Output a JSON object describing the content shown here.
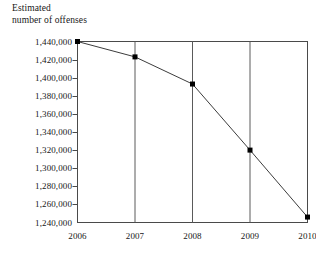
{
  "chart_data": {
    "type": "line",
    "title": "",
    "ylabel": "Estimated\nnumber of offenses",
    "xlabel": "",
    "categories": [
      "2006",
      "2007",
      "2008",
      "2009",
      "2010"
    ],
    "x": [
      2006,
      2007,
      2008,
      2009,
      2010
    ],
    "values": [
      1440000,
      1423000,
      1393000,
      1320000,
      1246000
    ],
    "series": [
      {
        "name": "Estimated number of offenses",
        "values": [
          1440000,
          1423000,
          1393000,
          1320000,
          1246000
        ]
      }
    ],
    "ylim": [
      1240000,
      1440000
    ],
    "ytick_values": [
      1440000,
      1420000,
      1400000,
      1380000,
      1360000,
      1340000,
      1320000,
      1300000,
      1280000,
      1260000,
      1240000
    ],
    "ytick_labels": [
      "1,440,000",
      "1,420,000",
      "1,400,000",
      "1,380,000",
      "1,360,000",
      "1,340,000",
      "1,320,000",
      "1,300,000",
      "1,280,000",
      "1,260,000",
      "1,240,000"
    ],
    "xtick_labels": [
      "2006",
      "2007",
      "2008",
      "2009",
      "2010"
    ],
    "grid": "vertical-only",
    "legend": "none",
    "marker": "filled-square",
    "line_color": "#3c3c3c",
    "marker_color": "#000000",
    "axis_color": "#4a4a4a",
    "gridline_color": "#5a5a5a",
    "background_color": "#ffffff"
  },
  "axis_title": {
    "line1": "Estimated",
    "line2": "number of offenses",
    "text": "Estimated\nnumber of offenses"
  }
}
